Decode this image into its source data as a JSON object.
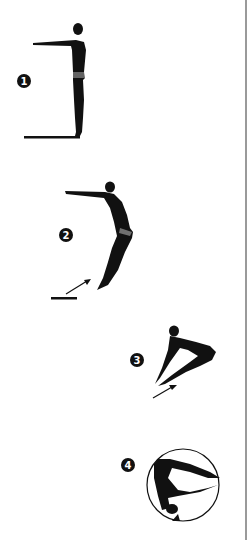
{
  "diagram": {
    "steps": [
      {
        "number": "1",
        "pose": "standing-arms-forward"
      },
      {
        "number": "2",
        "pose": "takeoff-lean"
      },
      {
        "number": "3",
        "pose": "pike"
      },
      {
        "number": "4",
        "pose": "inverted-rotation"
      }
    ]
  },
  "colors": {
    "figure": "#111111",
    "background": "#ffffff",
    "border": "#9a9a9a"
  }
}
